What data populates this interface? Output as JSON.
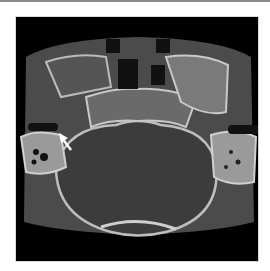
{
  "figure": {
    "type": "axial CT scan, skull base / temporal bone",
    "annotation": {
      "kind": "arrow",
      "color": "#ffffff",
      "direction": "pointing down-left toward right middle ear region"
    },
    "colors": {
      "background": "#000000",
      "soft_tissue": "#4a4a4a",
      "bone": "#cfcfcf",
      "air": "#0a0a0a",
      "frame_border": "#d8d8d8",
      "top_rule": "#8a8a8a"
    }
  }
}
